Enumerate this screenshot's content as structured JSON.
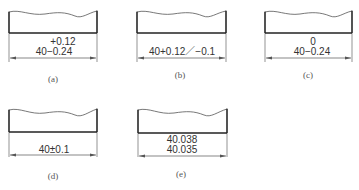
{
  "figures": [
    {
      "id": "a",
      "caption": "(a)",
      "line1": "+0.12",
      "line2": "40−0.24"
    },
    {
      "id": "b",
      "caption": "(b)",
      "line1": "",
      "line2": "40+0.12／−0.1"
    },
    {
      "id": "c",
      "caption": "(c)",
      "line1": "0",
      "line2": "40−0.24"
    },
    {
      "id": "d",
      "caption": "(d)",
      "line1": "",
      "line2": "40±0.1"
    },
    {
      "id": "e",
      "caption": "(e)",
      "line1": "40.038",
      "line2": "40.035"
    }
  ]
}
